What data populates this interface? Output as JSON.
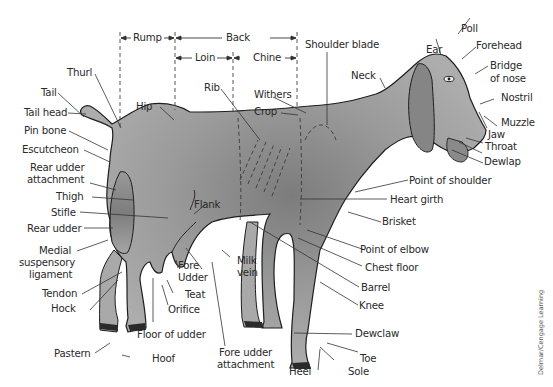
{
  "credit": "Delmar/Cengage Learning",
  "colors": {
    "body_fill": "#a7a7a7",
    "body_dark": "#7a7a7a",
    "outline": "#1e1e1e",
    "leader": "#333333",
    "hoof": "#2a2a2a",
    "background": "#ffffff"
  },
  "dimension_labels": {
    "rump": "Rump",
    "back": "Back",
    "loin": "Loin",
    "chine": "Chine"
  },
  "labels": {
    "shoulder_blade": "Shoulder blade",
    "poll": "Poll",
    "forehead": "Forehead",
    "ear": "Ear",
    "bridge_of_nose_1": "Bridge",
    "bridge_of_nose_2": "of nose",
    "neck": "Neck",
    "nostril": "Nostril",
    "muzzle": "Muzzle",
    "jaw": "Jaw",
    "throat": "Throat",
    "dewlap": "Dewlap",
    "thurl": "Thurl",
    "tail": "Tail",
    "tail_head": "Tail head",
    "hip": "Hip",
    "rib": "Rib",
    "withers": "Withers",
    "crop": "Crop",
    "pin_bone": "Pin bone",
    "escutcheon": "Escutcheon",
    "rear_udder_attachment_1": "Rear udder",
    "rear_udder_attachment_2": "attachment",
    "thigh": "Thigh",
    "stifle": "Stifle",
    "rear_udder": "Rear udder",
    "medial_suspensory_ligament_1": "Medial",
    "medial_suspensory_ligament_2": "suspensory",
    "medial_suspensory_ligament_3": "ligament",
    "flank": "Flank",
    "point_of_shoulder": "Point of shoulder",
    "heart_girth": "Heart girth",
    "brisket": "Brisket",
    "point_of_elbow": "Point of elbow",
    "chest_floor": "Chest floor",
    "barrel": "Barrel",
    "knee": "Knee",
    "tendon": "Tendon",
    "hock": "Hock",
    "fore_udder_1": "Fore",
    "fore_udder_2": "Udder",
    "teat": "Teat",
    "orifice": "Orifice",
    "milk_vein_1": "Milk",
    "milk_vein_2": "vein",
    "floor_of_udder": "Floor of udder",
    "fore_udder_attachment_1": "Fore udder",
    "fore_udder_attachment_2": "attachment",
    "pastern": "Pastern",
    "hoof": "Hoof",
    "dewclaw": "Dewclaw",
    "toe": "Toe",
    "heel": "Heel",
    "sole": "Sole"
  }
}
